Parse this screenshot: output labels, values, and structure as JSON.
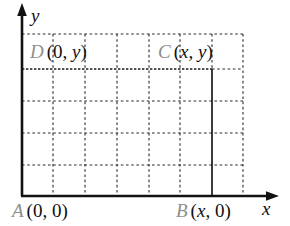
{
  "figure": {
    "background_color": "#ffffff",
    "axis_color": "#111111",
    "grid_color": "#333333",
    "vertex_letter_color": "#8e8e8e",
    "coord_text_color": "#111111"
  },
  "axes": {
    "x_label": "x",
    "y_label": "y",
    "x_axis": {
      "y": 196,
      "x_start": 22,
      "x_end": 278,
      "arrow": "right"
    },
    "y_axis": {
      "x": 22,
      "y_start": 196,
      "y_end": 5,
      "arrow": "up"
    }
  },
  "grid": {
    "style": "dashed",
    "vertical_lines_x": [
      53,
      85,
      117,
      149,
      180,
      212,
      243
    ],
    "horizontal_lines_y": [
      34,
      69,
      101,
      133,
      165
    ],
    "extent": {
      "left": 22,
      "right": 243,
      "top": 34,
      "bottom": 196
    }
  },
  "rectangle": {
    "style": "solid",
    "left": 22,
    "right": 212,
    "top": 69,
    "bottom": 196
  },
  "vertices": [
    {
      "id": "A",
      "letter": "A",
      "coords_open": "(0,",
      "coords_x": "0",
      "coords_mid": ", ",
      "coords_y": "0",
      "coords_close": ")",
      "coords_text": "(0, 0)",
      "x_is_var": false,
      "y_is_var": false
    },
    {
      "id": "B",
      "letter": "B",
      "coords_text": "(x, 0)",
      "x_is_var": true,
      "y_is_var": false
    },
    {
      "id": "C",
      "letter": "C",
      "coords_text": "(x, y)",
      "x_is_var": true,
      "y_is_var": true
    },
    {
      "id": "D",
      "letter": "D",
      "coords_text": "(0, y)",
      "x_is_var": false,
      "y_is_var": true
    }
  ],
  "labels": {
    "A": {
      "letter": "A",
      "open": "(",
      "x": "0",
      "comma": ", ",
      "y": "0",
      "close": ")"
    },
    "B": {
      "letter": "B",
      "open": "(",
      "x": "x",
      "comma": ", ",
      "y": "0",
      "close": ")"
    },
    "C": {
      "letter": "C",
      "open": "(",
      "x": "x",
      "comma": ", ",
      "y": "y",
      "close": ")"
    },
    "D": {
      "letter": "D",
      "open": "(",
      "x": "0",
      "comma": ", ",
      "y": "y",
      "close": ")"
    }
  }
}
